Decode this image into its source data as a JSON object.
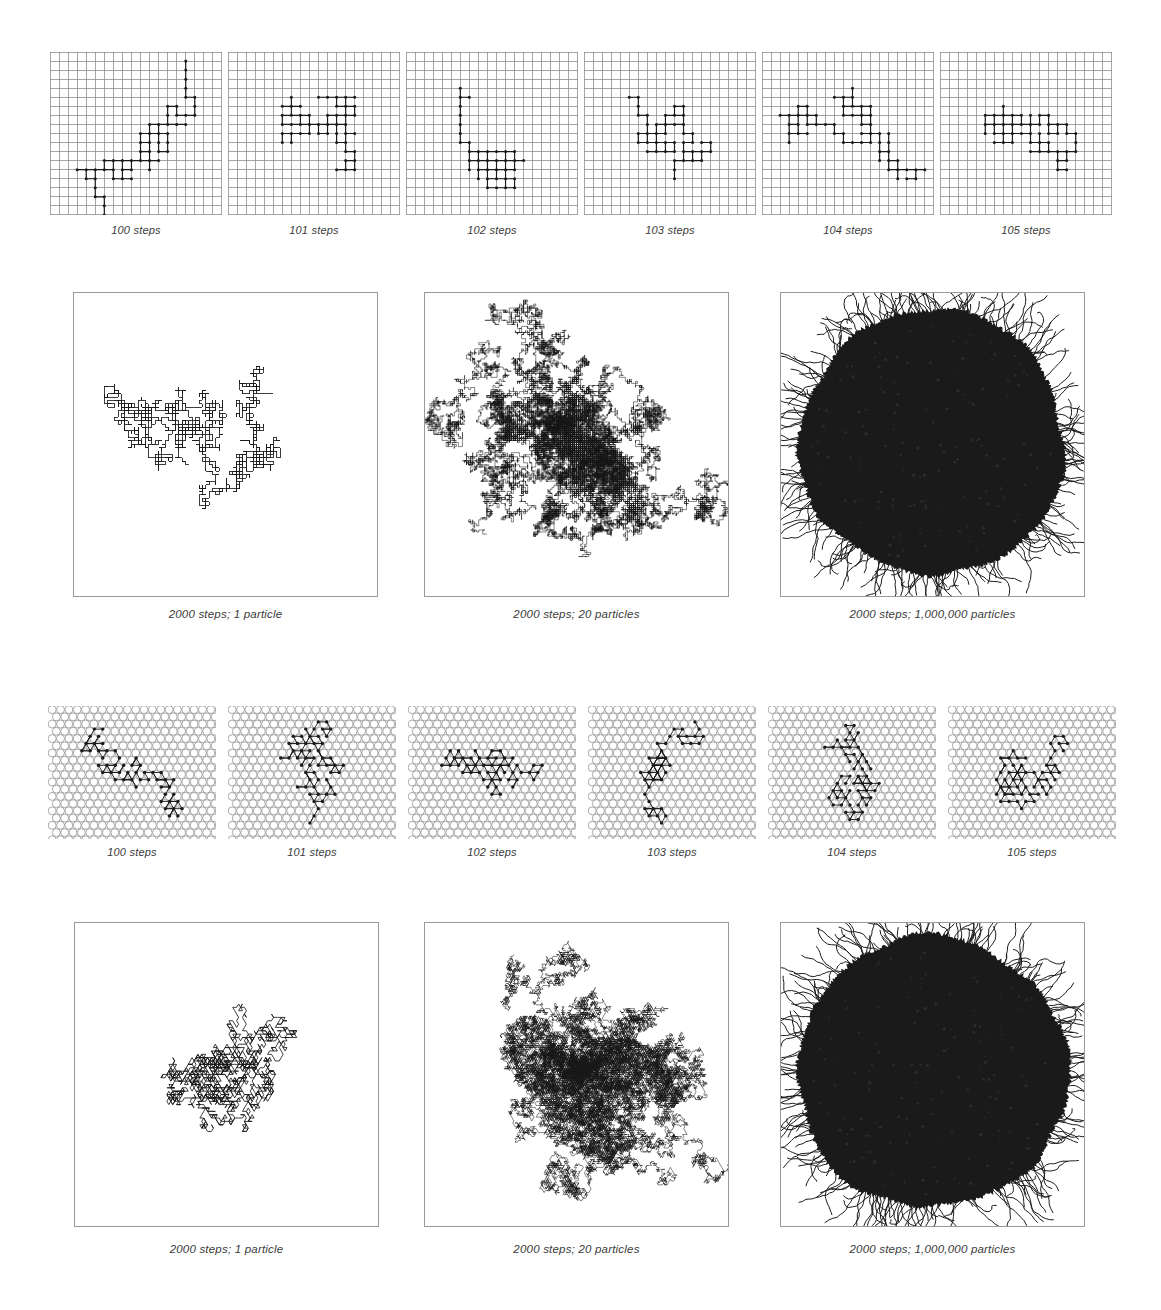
{
  "figure": {
    "background_color": "#ffffff",
    "ink_color": "#1a1a1a",
    "lattice_line_color": "#8f8f8f",
    "panel_border_color": "#9a9a9a",
    "caption_color": "#3b3b3b"
  },
  "sections": [
    {
      "id": "square-lattice-steps",
      "lattice": "square",
      "panels": [
        {
          "id": "sq-100",
          "caption": "100 steps",
          "steps": 100,
          "particles": 1
        },
        {
          "id": "sq-101",
          "caption": "101 steps",
          "steps": 101,
          "particles": 1
        },
        {
          "id": "sq-102",
          "caption": "102 steps",
          "steps": 102,
          "particles": 1
        },
        {
          "id": "sq-103",
          "caption": "103 steps",
          "steps": 103,
          "particles": 1
        },
        {
          "id": "sq-104",
          "caption": "104 steps",
          "steps": 104,
          "particles": 1
        },
        {
          "id": "sq-105",
          "caption": "105 steps",
          "steps": 105,
          "particles": 1
        }
      ]
    },
    {
      "id": "square-lattice-large",
      "lattice": "square",
      "panels": [
        {
          "id": "sq-big-1",
          "caption": "2000 steps; 1 particle",
          "steps": 2000,
          "particles": 1
        },
        {
          "id": "sq-big-20",
          "caption": "2000 steps; 20 particles",
          "steps": 2000,
          "particles": 20
        },
        {
          "id": "sq-big-1m",
          "caption": "2000 steps; 1,000,000 particles",
          "steps": 2000,
          "particles": 1000000
        }
      ]
    },
    {
      "id": "triangular-lattice-steps",
      "lattice": "triangular",
      "panels": [
        {
          "id": "tri-100",
          "caption": "100 steps",
          "steps": 100,
          "particles": 1
        },
        {
          "id": "tri-101",
          "caption": "101 steps",
          "steps": 101,
          "particles": 1
        },
        {
          "id": "tri-102",
          "caption": "102 steps",
          "steps": 102,
          "particles": 1
        },
        {
          "id": "tri-103",
          "caption": "103 steps",
          "steps": 103,
          "particles": 1
        },
        {
          "id": "tri-104",
          "caption": "104 steps",
          "steps": 104,
          "particles": 1
        },
        {
          "id": "tri-105",
          "caption": "105 steps",
          "steps": 105,
          "particles": 1
        }
      ]
    },
    {
      "id": "triangular-lattice-large",
      "lattice": "triangular",
      "panels": [
        {
          "id": "tri-big-1",
          "caption": "2000 steps; 1 particle",
          "steps": 2000,
          "particles": 1
        },
        {
          "id": "tri-big-20",
          "caption": "2000 steps; 20 particles",
          "steps": 2000,
          "particles": 20
        },
        {
          "id": "tri-big-1m",
          "caption": "2000 steps; 1,000,000 particles",
          "steps": 2000,
          "particles": 1000000
        }
      ]
    }
  ],
  "chart_data": {
    "type": "scatter",
    "xlabel": "",
    "ylabel": "",
    "grid": true,
    "legend": "none",
    "series": [
      {
        "name": "square lattice, 100 steps",
        "lattice": "square",
        "steps": 100,
        "particles": 1
      },
      {
        "name": "square lattice, 101 steps",
        "lattice": "square",
        "steps": 101,
        "particles": 1
      },
      {
        "name": "square lattice, 102 steps",
        "lattice": "square",
        "steps": 102,
        "particles": 1
      },
      {
        "name": "square lattice, 103 steps",
        "lattice": "square",
        "steps": 103,
        "particles": 1
      },
      {
        "name": "square lattice, 104 steps",
        "lattice": "square",
        "steps": 104,
        "particles": 1
      },
      {
        "name": "square lattice, 105 steps",
        "lattice": "square",
        "steps": 105,
        "particles": 1
      },
      {
        "name": "square lattice, 2000 steps, 1 particle",
        "lattice": "square",
        "steps": 2000,
        "particles": 1
      },
      {
        "name": "square lattice, 2000 steps, 20 particles",
        "lattice": "square",
        "steps": 2000,
        "particles": 20
      },
      {
        "name": "square lattice, 2000 steps, 1,000,000 particles",
        "lattice": "square",
        "steps": 2000,
        "particles": 1000000
      },
      {
        "name": "triangular lattice, 100 steps",
        "lattice": "triangular",
        "steps": 100,
        "particles": 1
      },
      {
        "name": "triangular lattice, 101 steps",
        "lattice": "triangular",
        "steps": 101,
        "particles": 1
      },
      {
        "name": "triangular lattice, 102 steps",
        "lattice": "triangular",
        "steps": 102,
        "particles": 1
      },
      {
        "name": "triangular lattice, 103 steps",
        "lattice": "triangular",
        "steps": 103,
        "particles": 1
      },
      {
        "name": "triangular lattice, 104 steps",
        "lattice": "triangular",
        "steps": 104,
        "particles": 1
      },
      {
        "name": "triangular lattice, 105 steps",
        "lattice": "triangular",
        "steps": 105,
        "particles": 1
      },
      {
        "name": "triangular lattice, 2000 steps, 1 particle",
        "lattice": "triangular",
        "steps": 2000,
        "particles": 1
      },
      {
        "name": "triangular lattice, 2000 steps, 20 particles",
        "lattice": "triangular",
        "steps": 2000,
        "particles": 20
      },
      {
        "name": "triangular lattice, 2000 steps, 1,000,000 particles",
        "lattice": "triangular",
        "steps": 2000,
        "particles": 1000000
      }
    ]
  }
}
